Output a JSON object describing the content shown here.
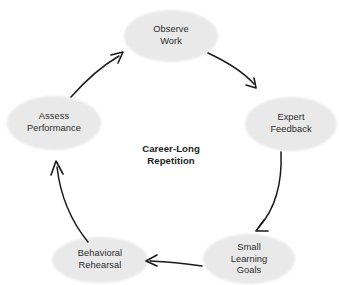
{
  "diagram": {
    "title": "Career-Long Repetition",
    "center_label": "Career-Long\nRepetition",
    "background_color": "#ffffff",
    "node_fill_color": "#e9e9e9",
    "node_text_color": "#2b2b2b",
    "arrow_color": "#1a1a1a",
    "center_text_color": "#1d1d1d",
    "direction": "clockwise",
    "nodes": [
      {
        "id": "observe-work",
        "label": "Observe\nWork",
        "text": "Observe Work",
        "cx": 171,
        "cy": 36,
        "rx": 47,
        "ry": 26
      },
      {
        "id": "expert-feedback",
        "label": "Expert\nFeedback",
        "text": "Expert Feedback",
        "cx": 291,
        "cy": 124,
        "rx": 46,
        "ry": 27
      },
      {
        "id": "small-learning-goals",
        "label": "Small\nLearning\nGoals",
        "text": "Small Learning Goals",
        "cx": 249,
        "cy": 259,
        "rx": 46,
        "ry": 25
      },
      {
        "id": "behavioral-rehearsal",
        "label": "Behavioral\nRehearsal",
        "text": "Behavioral Rehearsal",
        "cx": 100,
        "cy": 260,
        "rx": 48,
        "ry": 23
      },
      {
        "id": "assess-performance",
        "label": "Assess\nPerformance",
        "text": "Assess Performance",
        "cx": 54,
        "cy": 123,
        "rx": 47,
        "ry": 27
      }
    ],
    "arrows": [
      {
        "id": "arrow-observe-to-expert",
        "from": "observe-work",
        "to": "expert-feedback"
      },
      {
        "id": "arrow-expert-to-goals",
        "from": "expert-feedback",
        "to": "small-learning-goals"
      },
      {
        "id": "arrow-goals-to-rehearsal",
        "from": "small-learning-goals",
        "to": "behavioral-rehearsal"
      },
      {
        "id": "arrow-rehearsal-to-assess",
        "from": "behavioral-rehearsal",
        "to": "assess-performance"
      },
      {
        "id": "arrow-assess-to-observe",
        "from": "assess-performance",
        "to": "observe-work"
      }
    ]
  }
}
